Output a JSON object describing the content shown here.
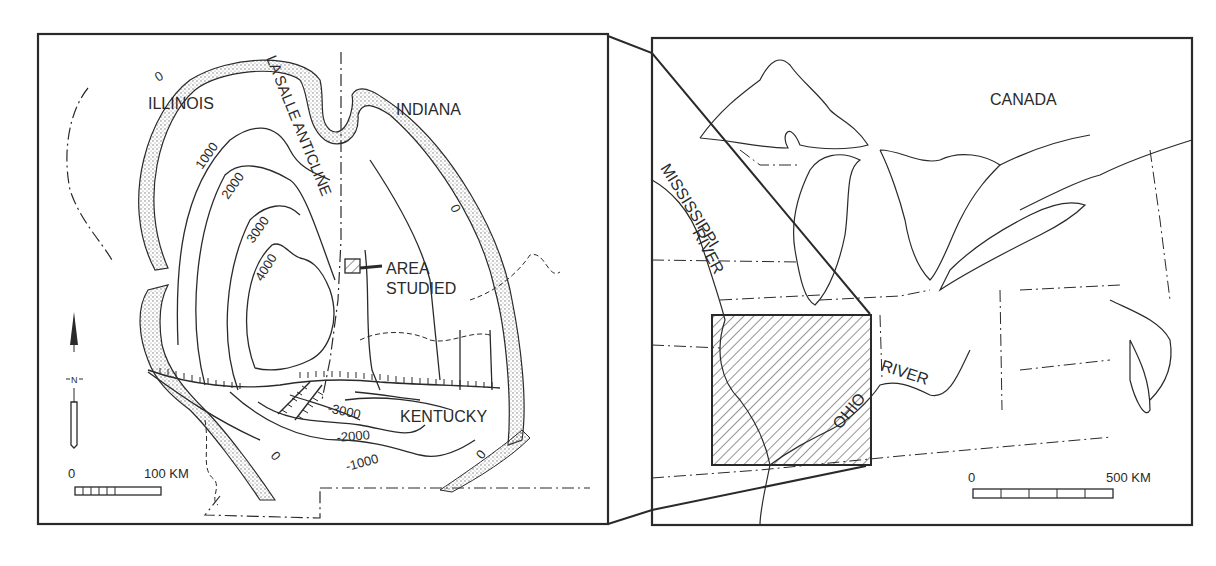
{
  "left_map": {
    "states": {
      "illinois": "ILLINOIS",
      "indiana": "INDIANA",
      "kentucky": "KENTUCKY"
    },
    "structure_label": "LA SALLE ANTICLINE",
    "area_label_line1": "AREA",
    "area_label_line2": "STUDIED",
    "contours": {
      "c0_top": "0",
      "c1000": "1000",
      "c2000": "2000",
      "c3000": "3000",
      "c4000": "4000",
      "c0_right": "0",
      "c3000_south": "-3000",
      "c2000_south": "-2000",
      "c1000_south": "-1000",
      "c0_south_left": "0",
      "c0_south_right": "0"
    },
    "north_arrow": "N",
    "scale": {
      "start": "0",
      "end": "100 KM"
    }
  },
  "right_map": {
    "country_label": "CANADA",
    "river1_line1": "MISSISSIPPI",
    "river1_line2": "RIVER",
    "river2_line1": "OHIO",
    "river2_line2": "RIVER",
    "scale": {
      "start": "0",
      "end": "500 KM"
    }
  },
  "colors": {
    "ink": "#2a2a2a",
    "paper": "#ffffff",
    "stipple": "#8a8a8a"
  }
}
